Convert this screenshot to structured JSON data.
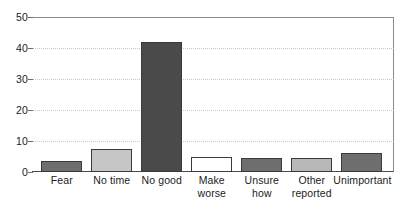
{
  "chart_data": {
    "type": "bar",
    "title": "",
    "subtitle": "",
    "xlabel": "",
    "ylabel": "",
    "ylim": [
      0,
      50
    ],
    "yticks": [
      0,
      10,
      20,
      30,
      40,
      50
    ],
    "ytick_labels": [
      "0",
      "10",
      "20",
      "30",
      "40",
      "50"
    ],
    "grid": "horizontal-dotted",
    "legend": "none",
    "categories": [
      "Fear",
      "No time",
      "No good",
      "Make worse",
      "Unsure how",
      "Other reported",
      "Unimportant"
    ],
    "category_label_lines": [
      [
        "Fear"
      ],
      [
        "No time"
      ],
      [
        "No good"
      ],
      [
        "Make",
        "worse"
      ],
      [
        "Unsure",
        "how"
      ],
      [
        "Other",
        "reported"
      ],
      [
        "Unimportant"
      ]
    ],
    "values": [
      3.5,
      7.5,
      42,
      5,
      4.5,
      4.5,
      6
    ],
    "bar_colors": [
      "#6e6e6e",
      "#c6c6c6",
      "#4a4a4a",
      "#ffffff",
      "#6e6e6e",
      "#b8b8b8",
      "#6e6e6e"
    ],
    "bar_edge_color": "#3a3a3a",
    "axis_color": "#6e6e6e",
    "grid_color": "#c9c9c9",
    "background_color": "#ffffff",
    "text_color": "#1c1c1c"
  }
}
